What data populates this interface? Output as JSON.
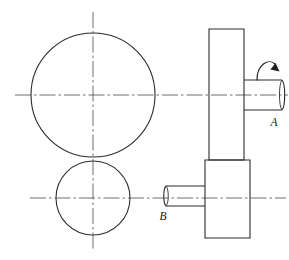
{
  "drawing": {
    "title": "Mechanical assembly orthographic drawing",
    "description": "Front view with two circles (large pulley and small pulley) and right side view showing stepped body with two shafts",
    "background_color": "#ffffff",
    "line_color": "#2b2b2b",
    "centerline_color": "#4a4a4a",
    "canvas": {
      "width": 289,
      "height": 260
    },
    "front_view": {
      "name": "front-view",
      "large_circle": {
        "name": "large-circle",
        "cx": 93,
        "cy": 95,
        "r": 62
      },
      "small_circle": {
        "name": "small-circle",
        "cx": 93,
        "cy": 198,
        "r": 37
      },
      "vertical_centerline": {
        "name": "vertical-centerline",
        "x": 93,
        "y1": 12,
        "y2": 250
      },
      "upper_horizontal_centerline": {
        "name": "upper-horizontal-centerline",
        "y": 95,
        "x1": 15,
        "x2": 288
      },
      "lower_horizontal_centerline": {
        "name": "lower-horizontal-centerline",
        "y": 198,
        "x1": 30,
        "x2": 286
      }
    },
    "side_view": {
      "name": "side-view",
      "upper_body": {
        "name": "upper-body-rectangle",
        "x": 209,
        "y": 29,
        "width": 35,
        "height": 131
      },
      "lower_body": {
        "name": "lower-body-rectangle",
        "x": 205,
        "y": 160,
        "width": 45,
        "height": 78
      },
      "shaft_a": {
        "name": "shaft-a",
        "x1": 244,
        "x2": 282,
        "y_top": 80,
        "y_bottom": 110,
        "ellipse_rx": 3.5
      },
      "shaft_b": {
        "name": "shaft-b",
        "x1": 166,
        "x2": 205,
        "y_top": 186,
        "y_bottom": 206,
        "ellipse_rx": 3
      },
      "rotation_arrow": {
        "name": "rotation-arrow",
        "description": "curved arrow over shaft A indicating rotation direction"
      }
    },
    "labels": [
      {
        "id": "label-a",
        "text": "A",
        "x": 274,
        "y": 126
      },
      {
        "id": "label-b",
        "text": "B",
        "x": 163,
        "y": 220
      }
    ]
  }
}
